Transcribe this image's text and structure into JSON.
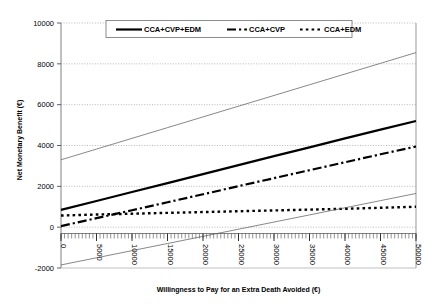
{
  "chart_data": {
    "type": "line",
    "title": "",
    "xlabel": "Willingness to Pay for an Extra Death Avoided (€)",
    "ylabel": "Net Monetary Benefit (€)",
    "xlim": [
      0,
      50000
    ],
    "ylim": [
      -2000,
      10000
    ],
    "xticks": [
      "0",
      "5000",
      "10000",
      "15000",
      "20000",
      "25000",
      "30000",
      "35000",
      "40000",
      "45000",
      "50000"
    ],
    "yticks": [
      "-2000",
      "0",
      "2000",
      "4000",
      "6000",
      "8000",
      "10000"
    ],
    "grid": "horizontal-dotted",
    "legend_position": "top-inside",
    "x": [
      0,
      5000,
      10000,
      15000,
      20000,
      25000,
      30000,
      35000,
      40000,
      45000,
      50000
    ],
    "series": [
      {
        "name": "CCA+CVP+EDM",
        "style": "solid",
        "width": 2.2,
        "color": "#000000",
        "in_legend": true,
        "values": [
          850,
          1280,
          1720,
          2160,
          2600,
          3040,
          3480,
          3910,
          4350,
          4780,
          5200
        ]
      },
      {
        "name": "CCA+CVP",
        "style": "dashdot",
        "width": 2.2,
        "color": "#000000",
        "in_legend": true,
        "values": [
          50,
          440,
          830,
          1220,
          1610,
          2010,
          2400,
          2790,
          3180,
          3570,
          3950
        ]
      },
      {
        "name": "CCA+EDM",
        "style": "dotted",
        "width": 2.4,
        "color": "#000000",
        "in_legend": true,
        "values": [
          570,
          620,
          660,
          700,
          740,
          780,
          820,
          860,
          900,
          950,
          1000
        ]
      },
      {
        "name": "upper-bound",
        "style": "thin-solid",
        "width": 0.7,
        "color": "#555555",
        "in_legend": false,
        "values": [
          3300,
          3825,
          4350,
          4875,
          5400,
          5925,
          6450,
          6975,
          7500,
          8025,
          8550
        ]
      },
      {
        "name": "lower-bound",
        "style": "thin-solid",
        "width": 0.7,
        "color": "#555555",
        "in_legend": false,
        "values": [
          -1850,
          -1500,
          -1150,
          -800,
          -450,
          -100,
          250,
          600,
          950,
          1300,
          1650
        ]
      }
    ]
  },
  "legend": {
    "items": [
      {
        "label": "CCA+CVP+EDM",
        "style": "solid"
      },
      {
        "label": "CCA+CVP",
        "style": "dashdot"
      },
      {
        "label": "CCA+EDM",
        "style": "dotted"
      }
    ]
  }
}
